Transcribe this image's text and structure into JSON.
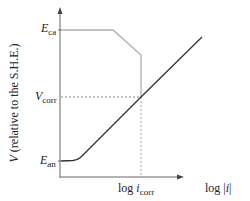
{
  "diagram": {
    "title": "",
    "y_axis_label_symbol": "V",
    "y_axis_label_text": "(relative to the S.H.E.)",
    "x_axis_label_prefix": "log |",
    "x_axis_label_var": "i",
    "x_axis_label_suffix": "|",
    "labels": {
      "e_ca": {
        "base": "E",
        "sub": "ca"
      },
      "v_corr": {
        "base": "V",
        "sub": "corr"
      },
      "e_an": {
        "base": "E",
        "sub": "an"
      },
      "log_icorr": {
        "prefix": "log ",
        "base": "i",
        "sub": "corr"
      }
    },
    "colors": {
      "anodic_line": "#333333",
      "cathodic_line": "#aaaaaa",
      "axes": "#555555",
      "guide": "#999999"
    }
  }
}
